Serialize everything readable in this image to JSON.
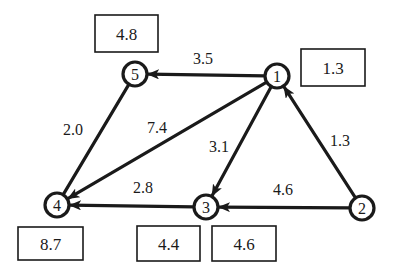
{
  "diagram": {
    "type": "directed-weighted-graph",
    "colors": {
      "stroke": "#1a1a1a",
      "background": "#ffffff"
    },
    "nodes": [
      {
        "id": "1",
        "label": "1",
        "x": 277,
        "y": 76,
        "value_box": {
          "label": "1.3",
          "x": 301,
          "y": 49,
          "w": 64,
          "h": 37
        }
      },
      {
        "id": "2",
        "label": "2",
        "x": 362,
        "y": 208,
        "value_box": null
      },
      {
        "id": "3",
        "label": "3",
        "x": 206,
        "y": 207,
        "value_box": {
          "label": "4.4",
          "x": 137,
          "y": 226,
          "w": 63,
          "h": 35
        }
      },
      {
        "id": "4",
        "label": "4",
        "x": 57,
        "y": 205,
        "value_box": {
          "label": "8.7",
          "x": 18,
          "y": 227,
          "w": 65,
          "h": 33
        }
      },
      {
        "id": "5",
        "label": "5",
        "x": 135,
        "y": 74,
        "value_box": {
          "label": "4.8",
          "x": 95,
          "y": 15,
          "w": 63,
          "h": 37
        }
      }
    ],
    "extra_boxes": [
      {
        "label": "4.6",
        "x": 212,
        "y": 226,
        "w": 64,
        "h": 35
      }
    ],
    "edges": [
      {
        "from": "1",
        "to": "5",
        "weight": "3.5",
        "directed": true,
        "label_x": 203,
        "label_y": 64
      },
      {
        "from": "1",
        "to": "4",
        "weight": "7.4",
        "directed": true,
        "label_x": 157,
        "label_y": 133
      },
      {
        "from": "1",
        "to": "3",
        "weight": "3.1",
        "directed": true,
        "label_x": 219,
        "label_y": 152
      },
      {
        "from": "2",
        "to": "1",
        "weight": "1.3",
        "directed": true,
        "label_x": 340,
        "label_y": 146
      },
      {
        "from": "2",
        "to": "3",
        "weight": "4.6",
        "directed": true,
        "label_x": 283,
        "label_y": 195
      },
      {
        "from": "3",
        "to": "4",
        "weight": "2.8",
        "directed": true,
        "label_x": 143,
        "label_y": 193
      },
      {
        "from": "5",
        "to": "4",
        "weight": "2.0",
        "directed": false,
        "label_x": 73,
        "label_y": 135
      }
    ]
  }
}
